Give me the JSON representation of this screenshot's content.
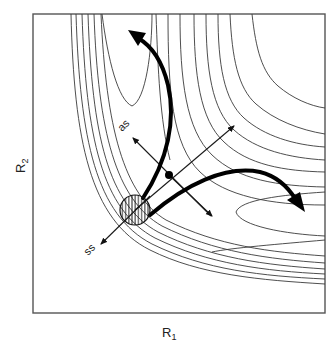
{
  "figure": {
    "type": "potential-energy-surface-contour-diagram",
    "x_axis": {
      "label": "R",
      "subscript": "1"
    },
    "y_axis": {
      "label": "R",
      "subscript": "2"
    },
    "labels": {
      "antisymmetric_stretch": "as",
      "symmetric_stretch": "ss"
    },
    "elements": {
      "saddle_point": "filled dot at the col between two valleys",
      "reactant_region": "hatched circle",
      "thick_arrows": [
        "trajectory curving up into R2 valley",
        "trajectory curving right into R1 valley"
      ],
      "thin_arrows": [
        "as (antisymmetric stretch) axis",
        "ss (symmetric stretch) axis",
        "diagonal through saddle"
      ]
    },
    "colors": {
      "ink": "#000000",
      "background": "#ffffff",
      "frame": "#555555"
    }
  }
}
